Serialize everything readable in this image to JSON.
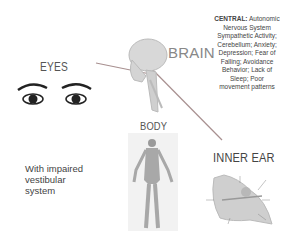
{
  "labels": {
    "eyes": "EYES",
    "brain": "BRAIN",
    "body": "BODY",
    "inner_ear": "INNER EAR"
  },
  "central": {
    "heading": "CENTRAL:",
    "text": "Autonomic Nervous System Sympathetic Activity; Cerebellum; Anxiety; Depression; Fear of Falling; Avoidance Behavior; Lack of Sleep; Poor movement patterns"
  },
  "note": "With impaired vestibular system",
  "icons": [
    "eye-icon",
    "skull-brain-illustration",
    "human-body-illustration",
    "inner-ear-illustration"
  ],
  "colors": {
    "connector": "#a08a8a",
    "text": "#444444",
    "brain_label": "#888888"
  }
}
